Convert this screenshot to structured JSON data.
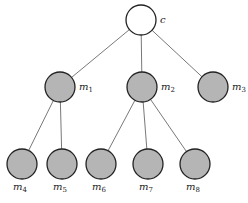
{
  "diagram": {
    "type": "tree",
    "colors": {
      "root_fill": "#ffffff",
      "node_fill": "#b5b5b5",
      "stroke": "#222222",
      "edge": "#555555"
    },
    "nodes": [
      {
        "id": "c",
        "label": "c",
        "sub": "",
        "x": 141,
        "y": 20,
        "r": 15,
        "root": true,
        "label_pos": "right"
      },
      {
        "id": "m1",
        "label": "m",
        "sub": "1",
        "x": 60,
        "y": 87,
        "r": 15,
        "root": false,
        "label_pos": "right"
      },
      {
        "id": "m2",
        "label": "m",
        "sub": "2",
        "x": 142,
        "y": 87,
        "r": 15,
        "root": false,
        "label_pos": "right"
      },
      {
        "id": "m3",
        "label": "m",
        "sub": "3",
        "x": 213,
        "y": 87,
        "r": 15,
        "root": false,
        "label_pos": "right"
      },
      {
        "id": "m4",
        "label": "m",
        "sub": "4",
        "x": 22,
        "y": 164,
        "r": 15,
        "root": false,
        "label_pos": "below"
      },
      {
        "id": "m5",
        "label": "m",
        "sub": "5",
        "x": 62,
        "y": 164,
        "r": 15,
        "root": false,
        "label_pos": "below"
      },
      {
        "id": "m6",
        "label": "m",
        "sub": "6",
        "x": 101,
        "y": 164,
        "r": 15,
        "root": false,
        "label_pos": "below"
      },
      {
        "id": "m7",
        "label": "m",
        "sub": "7",
        "x": 148,
        "y": 164,
        "r": 15,
        "root": false,
        "label_pos": "below"
      },
      {
        "id": "m8",
        "label": "m",
        "sub": "8",
        "x": 195,
        "y": 164,
        "r": 15,
        "root": false,
        "label_pos": "below"
      }
    ],
    "edges": [
      [
        "c",
        "m1"
      ],
      [
        "c",
        "m2"
      ],
      [
        "c",
        "m3"
      ],
      [
        "m1",
        "m4"
      ],
      [
        "m1",
        "m5"
      ],
      [
        "m2",
        "m6"
      ],
      [
        "m2",
        "m7"
      ],
      [
        "m2",
        "m8"
      ]
    ]
  }
}
